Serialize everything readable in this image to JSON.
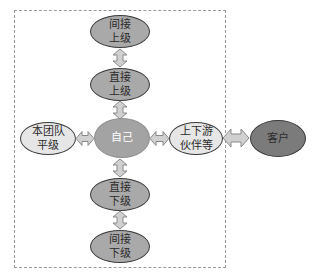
{
  "diagram": {
    "title": "",
    "nodes": {
      "indirect_superior": {
        "label": "间接\n上级",
        "shade": "mid"
      },
      "direct_superior": {
        "label": "直接\n上级",
        "shade": "mid"
      },
      "self": {
        "label": "自己",
        "shade": "mid"
      },
      "direct_subordinate": {
        "label": "直接\n下级",
        "shade": "mid"
      },
      "indirect_subordinate": {
        "label": "间接\n下级",
        "shade": "mid"
      },
      "team_peers": {
        "label": "本团队\n平级",
        "shade": "light"
      },
      "partners": {
        "label": "上下游\n伙伴等",
        "shade": "light"
      },
      "customer": {
        "label": "客户",
        "shade": "dark"
      }
    },
    "edges": [
      {
        "from": "indirect_superior",
        "to": "direct_superior",
        "type": "bidirectional"
      },
      {
        "from": "direct_superior",
        "to": "self",
        "type": "bidirectional"
      },
      {
        "from": "self",
        "to": "direct_subordinate",
        "type": "bidirectional"
      },
      {
        "from": "direct_subordinate",
        "to": "indirect_subordinate",
        "type": "bidirectional"
      },
      {
        "from": "team_peers",
        "to": "self",
        "type": "bidirectional"
      },
      {
        "from": "self",
        "to": "partners",
        "type": "bidirectional"
      },
      {
        "from": "partners",
        "to": "customer",
        "type": "bidirectional"
      }
    ],
    "boundary": "dashed rectangle enclosing internal relationships (excludes 客户)",
    "colors": {
      "mid": "#a9a9a9",
      "light": "#e6e6e6",
      "dark": "#7b7b7b",
      "arrow_fill": "#d0d0d0",
      "outline": "#3a3a3a"
    }
  }
}
